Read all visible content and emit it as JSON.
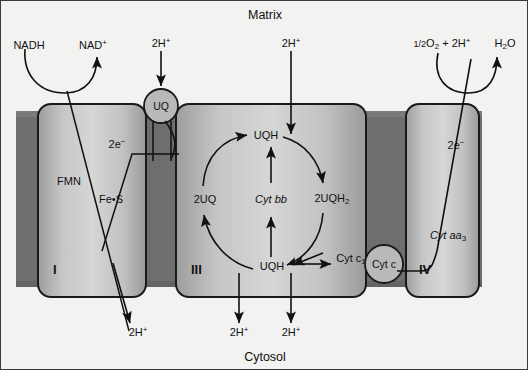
{
  "diagram": {
    "title_top": "Matrix",
    "title_bottom": "Cytosol",
    "compartments": {
      "matrix_label": "Matrix",
      "cytosol_label": "Cytosol"
    },
    "complexes": [
      {
        "id": "I",
        "numeral": "I",
        "cofactors": [
          "FMN",
          "Fe•S"
        ]
      },
      {
        "id": "III",
        "numeral": "III",
        "cofactors": [
          "Cyt bb",
          "Cyt c",
          "UQH",
          "2UQ",
          "2UQH",
          "Cyt c"
        ]
      },
      {
        "id": "IV",
        "numeral": "IV",
        "cofactors": [
          "Cyt aa"
        ]
      }
    ],
    "complex1": {
      "numeral": "I",
      "fmn": "FMN",
      "fes": "Fe•S",
      "electrons": "2e",
      "electrons_charge": "−"
    },
    "complex3": {
      "numeral": "III",
      "cyt_bb": "Cyt bb",
      "uqh_top": "UQH",
      "uqh_bottom": "UQH",
      "uq_left": "2UQ",
      "uqh2_right": "2UQH",
      "uqh2_sub": "2",
      "cyt_c1": "Cyt c",
      "cyt_c1_sub": "1"
    },
    "complex4": {
      "numeral": "IV",
      "cyt_aa3": "Cyt aa",
      "cyt_aa3_sub": "3",
      "electrons": "2e",
      "electrons_charge": "−"
    },
    "carriers": [
      {
        "name": "UQ",
        "label": "UQ"
      },
      {
        "name": "Cyt c",
        "label": "Cyt c"
      }
    ],
    "carrier_uq": {
      "label": "UQ"
    },
    "carrier_cytc": {
      "label": "Cyt c"
    },
    "substrates": {
      "nadh": "NADH",
      "nad_plus": "NAD",
      "nad_plus_charge": "+",
      "oxygen": "1/2",
      "oxygen_o": "O",
      "oxygen_sub": "2",
      "oxygen_plus": " + 2H",
      "oxygen_sup": "+",
      "water": "H",
      "water_sub": "2",
      "water_o": "O"
    },
    "protons_in": [
      {
        "label": "2H",
        "charge": "+",
        "position": "complex-i-top"
      },
      {
        "label": "2H",
        "charge": "+",
        "position": "complex-iii-top"
      }
    ],
    "proton_in_1": {
      "label": "2H",
      "charge": "+"
    },
    "proton_in_2": {
      "label": "2H",
      "charge": "+"
    },
    "protons_out": [
      {
        "label": "2H",
        "charge": "+",
        "position": "complex-i-bottom"
      },
      {
        "label": "2H",
        "charge": "+",
        "position": "complex-iii-bottom-left"
      },
      {
        "label": "2H",
        "charge": "+",
        "position": "complex-iii-bottom-right"
      }
    ],
    "proton_out_1": {
      "label": "2H",
      "charge": "+"
    },
    "proton_out_2": {
      "label": "2H",
      "charge": "+"
    },
    "proton_out_3": {
      "label": "2H",
      "charge": "+"
    },
    "colors": {
      "background": "#f2f2f0",
      "membrane": "#6e6e6e",
      "complex_fill": "#c9c9c9",
      "complex_edge": "#1a1a1a",
      "carrier_fill": "#b4b4b4",
      "text": "#111111",
      "frame": "#3a3a3a"
    }
  }
}
